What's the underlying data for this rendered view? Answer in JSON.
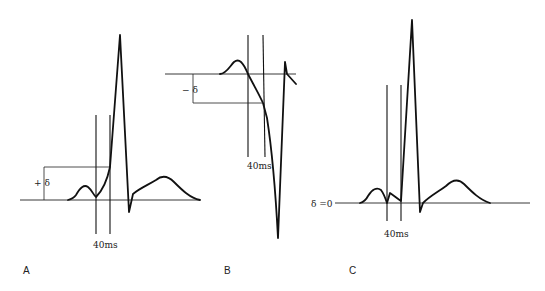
{
  "figure": {
    "panels": [
      {
        "id": "A",
        "label": "A",
        "delta_label": "+ δ",
        "interval_label": "40ms",
        "description": "Positive delta: ST point 40ms after QRS onset above baseline"
      },
      {
        "id": "B",
        "label": "B",
        "delta_label": "− δ",
        "interval_label": "40ms",
        "description": "Negative delta: point 40ms after onset below baseline"
      },
      {
        "id": "C",
        "label": "C",
        "delta_label": "δ =0",
        "interval_label": "40ms",
        "description": "Zero delta: point 40ms after onset at baseline"
      }
    ]
  }
}
